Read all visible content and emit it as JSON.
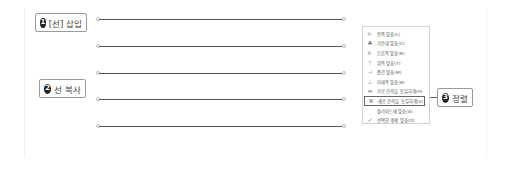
{
  "callouts": [
    {
      "number": "1",
      "label": "[선] 삽입"
    },
    {
      "number": "2",
      "label": "선 복사"
    },
    {
      "number": "3",
      "label": "정렬"
    }
  ],
  "lines_count": 5,
  "align_menu": {
    "items": [
      {
        "icon": "align-left-icon",
        "glyph": "⊫",
        "label": "왼쪽 맞춤(L)"
      },
      {
        "icon": "align-center-icon",
        "glyph": "♣",
        "label": "가운데 맞춤(C)"
      },
      {
        "icon": "align-right-icon",
        "glyph": "⊪",
        "label": "오른쪽 맞춤(R)"
      },
      {
        "icon": "align-top-icon",
        "glyph": "⊤",
        "label": "위쪽 맞춤(T)"
      },
      {
        "icon": "align-middle-icon",
        "glyph": "⊣",
        "label": "중간 맞춤(M)"
      },
      {
        "icon": "align-bottom-icon",
        "glyph": "⊥",
        "label": "아래쪽 맞춤(B)"
      },
      {
        "icon": "distribute-horizontal-icon",
        "glyph": "⇹",
        "label": "가로 간격을 동일하게(H)"
      },
      {
        "icon": "distribute-vertical-icon",
        "glyph": "≣",
        "label": "세로 간격을 동일하게(V)",
        "highlighted": true
      },
      {
        "icon": "",
        "glyph": "",
        "label": "슬라이드에 맞춤(A)"
      },
      {
        "icon": "check-icon",
        "glyph": "✓",
        "label": "선택한 개체 맞춤(O)"
      }
    ]
  }
}
